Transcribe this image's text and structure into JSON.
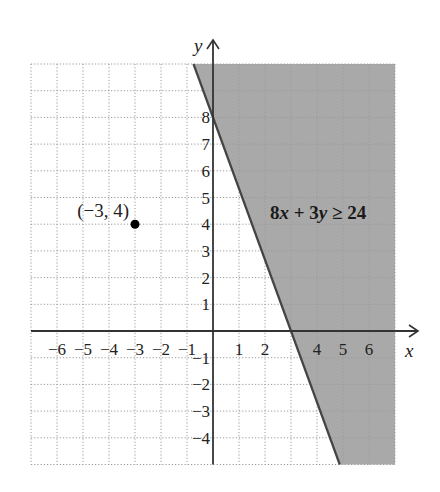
{
  "chart_data": {
    "type": "area",
    "title": "",
    "xlabel": "x",
    "ylabel": "y",
    "xlim": [
      -7,
      7
    ],
    "ylim": [
      -5,
      10
    ],
    "grid": true,
    "x_ticks": [
      -6,
      -5,
      -4,
      -3,
      -2,
      -1,
      1,
      2,
      4,
      5,
      6
    ],
    "x_tick_labels": [
      "−6",
      "−5",
      "−4",
      "−3",
      "−2",
      "−1",
      "1",
      "2",
      "4",
      "5",
      "6"
    ],
    "y_ticks": [
      8,
      7,
      6,
      5,
      4,
      3,
      2,
      1,
      -1,
      -2,
      -3,
      -4
    ],
    "y_tick_labels": [
      "8",
      "7",
      "6",
      "5",
      "4",
      "3",
      "2",
      "1",
      "−1",
      "−2",
      "−3",
      "−4"
    ],
    "boundary_line": {
      "equation": "8x + 3y = 24",
      "x_intercept": 3,
      "y_intercept": 8,
      "style": "solid"
    },
    "shaded_region": {
      "inequality": "8x + 3y ≥ 24",
      "side": "right",
      "color": "#a9a9a9"
    },
    "points": [
      {
        "x": -3,
        "y": 4,
        "label": "(−3, 4)"
      }
    ],
    "annotations": [
      {
        "text": "8x + 3y ≥ 24",
        "x": 4.2,
        "y": 4.6
      }
    ]
  },
  "labels": {
    "x_axis": "x",
    "y_axis": "y",
    "inequality_coef_a": "8",
    "inequality_var_x": "x",
    "inequality_op1": " + 3",
    "inequality_var_y": "y",
    "inequality_rest": " ≥ 24",
    "point_label": "(−3, 4)"
  },
  "colors": {
    "shade": "#a9a9a9",
    "axis": "#333333",
    "grid": "#9a9a9a",
    "line": "#444444",
    "point": "#000000"
  }
}
